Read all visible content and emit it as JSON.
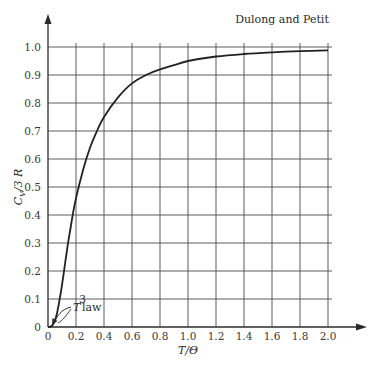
{
  "chart_data": {
    "type": "line",
    "title": "",
    "xlabel": "T/Θ",
    "ylabel": "C_V/3R",
    "xlim": [
      0,
      2.0
    ],
    "ylim": [
      0,
      1.0
    ],
    "grid": true,
    "x_ticks": [
      "0",
      "0.2",
      "0.4",
      "0.6",
      "0.8",
      "1.0",
      "1.2",
      "1.4",
      "1.6",
      "1.8",
      "2.0"
    ],
    "y_ticks": [
      "0",
      "0.1",
      "0.2",
      "0.3",
      "0.4",
      "0.5",
      "0.6",
      "0.7",
      "0.8",
      "0.9",
      "1.0"
    ],
    "series": [
      {
        "name": "Debye heat capacity",
        "x": [
          0,
          0.02,
          0.04,
          0.06,
          0.08,
          0.1,
          0.12,
          0.14,
          0.16,
          0.18,
          0.2,
          0.25,
          0.3,
          0.35,
          0.4,
          0.5,
          0.6,
          0.7,
          0.8,
          0.9,
          1.0,
          1.2,
          1.4,
          1.6,
          1.8,
          2.0
        ],
        "y": [
          0,
          0.002,
          0.012,
          0.04,
          0.09,
          0.15,
          0.22,
          0.29,
          0.35,
          0.41,
          0.46,
          0.56,
          0.64,
          0.7,
          0.75,
          0.82,
          0.87,
          0.9,
          0.92,
          0.935,
          0.95,
          0.966,
          0.975,
          0.981,
          0.985,
          0.988
        ]
      }
    ],
    "annotations": [
      {
        "text": "Dulong and Petit",
        "x": 1.75,
        "y": 1.01
      },
      {
        "text": "T³ law",
        "x": 0.2,
        "y": 0.07,
        "arrow_to": [
          0.03,
          0.005
        ]
      }
    ]
  },
  "labels": {
    "xlabel": "T/Θ",
    "ylabel_main": "C",
    "ylabel_sub": "V",
    "ylabel_rest": "/3 R",
    "dulong": "Dulong and Petit",
    "t3_T": "T",
    "t3_exp": "3",
    "t3_law": "law"
  },
  "colors": {
    "grid": "#4a4a4a",
    "curve": "#222222",
    "axis": "#2a2a2a"
  }
}
